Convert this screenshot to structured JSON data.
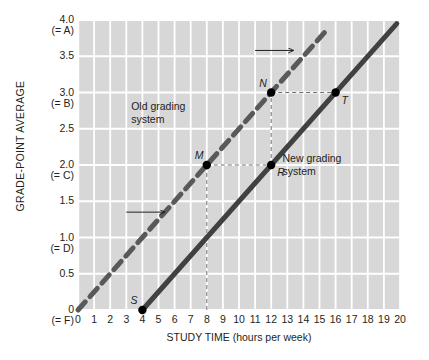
{
  "chart_data": {
    "type": "line",
    "title": "",
    "xlabel": "STUDY TIME (hours per week)",
    "ylabel": "GRADE-POINT AVERAGE",
    "xlim": [
      0,
      20
    ],
    "ylim": [
      0,
      4.0
    ],
    "grid": true,
    "legend_position": "in-plot annotations",
    "xticks": [
      "0",
      "1",
      "2",
      "3",
      "4",
      "5",
      "6",
      "7",
      "8",
      "9",
      "10",
      "11",
      "12",
      "13",
      "14",
      "15",
      "16",
      "17",
      "18",
      "19",
      "20"
    ],
    "yticks": [
      {
        "value": 4.0,
        "num": "4.0",
        "alpha": "(= A)"
      },
      {
        "value": 3.5,
        "num": "3.5",
        "alpha": ""
      },
      {
        "value": 3.0,
        "num": "3.0",
        "alpha": "(= B)"
      },
      {
        "value": 2.5,
        "num": "2.5",
        "alpha": ""
      },
      {
        "value": 2.0,
        "num": "2.0",
        "alpha": "(= C)"
      },
      {
        "value": 1.5,
        "num": "1.5",
        "alpha": ""
      },
      {
        "value": 1.0,
        "num": "1.0",
        "alpha": "(= D)"
      },
      {
        "value": 0.5,
        "num": "0.5",
        "alpha": ""
      },
      {
        "value": 0.0,
        "num": "0",
        "alpha": "(= F)"
      }
    ],
    "series": [
      {
        "name": "Old grading system",
        "style": "dashed",
        "color": "#58595b",
        "x": [
          0,
          15.5
        ],
        "y": [
          0,
          3.875
        ],
        "slope": 0.25,
        "intercept": 0
      },
      {
        "name": "New grading system",
        "style": "solid",
        "color": "#414042",
        "x": [
          4,
          19.8
        ],
        "y": [
          0,
          3.95
        ],
        "slope": 0.25,
        "intercept": -1.0
      }
    ],
    "points": [
      {
        "label": "S",
        "x": 4,
        "y": 0,
        "series": "New grading system",
        "label_position": "above-left"
      },
      {
        "label": "M",
        "x": 8,
        "y": 2.0,
        "series": "Old grading system",
        "label_position": "above-left"
      },
      {
        "label": "N",
        "x": 12,
        "y": 3.0,
        "series": "Old grading system",
        "label_position": "above-left"
      },
      {
        "label": "R",
        "x": 12,
        "y": 2.0,
        "series": "New grading system",
        "label_position": "below-right"
      },
      {
        "label": "T",
        "x": 16,
        "y": 3.0,
        "series": "New grading system",
        "label_position": "below-right"
      }
    ],
    "guide_lines": [
      {
        "from": [
          8,
          0
        ],
        "to": [
          8,
          2.0
        ],
        "style": "dashed"
      },
      {
        "from": [
          8,
          2.0
        ],
        "to": [
          12,
          2.0
        ],
        "style": "dashed"
      },
      {
        "from": [
          12,
          2.0
        ],
        "to": [
          12,
          3.0
        ],
        "style": "dashed"
      },
      {
        "from": [
          12,
          3.0
        ],
        "to": [
          16,
          3.0
        ],
        "style": "dashed"
      }
    ],
    "annotations": [
      {
        "text": "Old grading",
        "x": 3.3,
        "y": 2.82,
        "name": "old-grading-system-label-line1"
      },
      {
        "text": "system",
        "x": 3.3,
        "y": 2.64,
        "name": "old-grading-system-label-line2"
      },
      {
        "text": "New grading",
        "x": 12.7,
        "y": 2.1,
        "name": "new-grading-system-label-line1"
      },
      {
        "text": "system",
        "x": 12.7,
        "y": 1.92,
        "name": "new-grading-system-label-line2"
      }
    ],
    "arrows": [
      {
        "from": [
          11.0,
          3.58
        ],
        "to": [
          13.4,
          3.58
        ],
        "direction": "right",
        "name": "old-system-direction-arrow"
      },
      {
        "from": [
          3.0,
          1.35
        ],
        "to": [
          5.4,
          1.35
        ],
        "direction": "right",
        "name": "new-system-direction-arrow"
      }
    ]
  },
  "colors": {
    "plot_background": "#d7d7d7",
    "gridline": "#ffffff",
    "old_system_line": "#58595b",
    "new_system_line": "#414042",
    "text": "#231f20",
    "guide_line": "#6d6e71"
  }
}
